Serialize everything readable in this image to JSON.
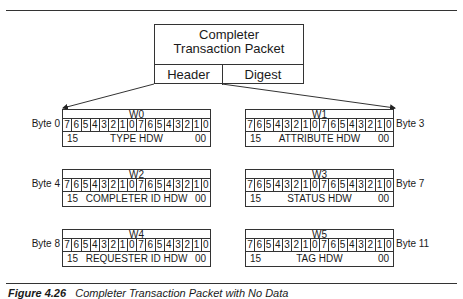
{
  "packet": {
    "title_line1": "Completer",
    "title_line2": "Transaction Packet",
    "fields": [
      "Header",
      "Digest"
    ]
  },
  "bit_labels": [
    "7",
    "6",
    "5",
    "4",
    "3",
    "2",
    "1",
    "0",
    "7",
    "6",
    "5",
    "4",
    "3",
    "2",
    "1",
    "0"
  ],
  "registers": [
    {
      "name": "W0",
      "byte": "Byte 0",
      "lo": "15",
      "field": "TYPE HDW",
      "hi": "00"
    },
    {
      "name": "W1",
      "byte": "Byte 3",
      "lo": "15",
      "field": "ATTRIBUTE HDW",
      "hi": "00"
    },
    {
      "name": "W2",
      "byte": "Byte 4",
      "lo": "15",
      "field": "COMPLETER ID HDW",
      "hi": "00"
    },
    {
      "name": "W3",
      "byte": "Byte 7",
      "lo": "15",
      "field": "STATUS HDW",
      "hi": "00"
    },
    {
      "name": "W4",
      "byte": "Byte 8",
      "lo": "15",
      "field": "REQUESTER ID HDW",
      "hi": "00"
    },
    {
      "name": "W5",
      "byte": "Byte 11",
      "lo": "15",
      "field": "TAG HDW",
      "hi": "00"
    }
  ],
  "caption": {
    "label": "Figure 4.26",
    "text": "Completer Transaction Packet with No Data"
  }
}
